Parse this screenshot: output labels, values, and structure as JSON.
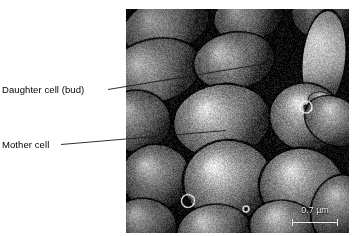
{
  "figure": {
    "kind": "scanning-electron-micrograph"
  },
  "annotations": [
    {
      "id": "daughter-cell",
      "label": "Daughter cell (bud)",
      "leader": {
        "x1": 108,
        "y1": 89.5,
        "x2": 266,
        "y2": 63.5
      }
    },
    {
      "id": "mother-cell",
      "label": "Mother cell",
      "leader": {
        "x1": 61,
        "y1": 144.5,
        "x2": 226,
        "y2": 130.5
      }
    }
  ],
  "scale_bar": {
    "value": "0.7",
    "unit": "µm",
    "text": "0.7 µm",
    "bar_color": "#f0f0f0",
    "text_color": "#f2f2f2"
  },
  "micrograph": {
    "background_color": "#0a0a0a",
    "panel": {
      "left": 126,
      "top": 9,
      "width": 223,
      "height": 224
    },
    "cells": [
      {
        "cx": 40,
        "cy": 16,
        "rx": 44,
        "ry": 27,
        "rot": -18,
        "tone": 0.44,
        "rim": 0.72
      },
      {
        "cx": 122,
        "cy": 8,
        "rx": 34,
        "ry": 24,
        "rot": -12,
        "tone": 0.4,
        "rim": 0.66
      },
      {
        "cx": 196,
        "cy": 6,
        "rx": 30,
        "ry": 24,
        "rot": 8,
        "tone": 0.34,
        "rim": 0.6
      },
      {
        "cx": 28,
        "cy": 62,
        "rx": 47,
        "ry": 31,
        "rot": -14,
        "tone": 0.46,
        "rim": 0.8
      },
      {
        "cx": 108,
        "cy": 52,
        "rx": 40,
        "ry": 28,
        "rot": -10,
        "tone": 0.42,
        "rim": 0.74
      },
      {
        "cx": 198,
        "cy": 50,
        "rx": 21,
        "ry": 48,
        "rot": 6,
        "tone": 0.74,
        "rim": 0.95
      },
      {
        "cx": 10,
        "cy": 112,
        "rx": 34,
        "ry": 30,
        "rot": 0,
        "tone": 0.44,
        "rim": 0.78
      },
      {
        "cx": 96,
        "cy": 112,
        "rx": 48,
        "ry": 36,
        "rot": -8,
        "tone": 0.5,
        "rim": 0.86
      },
      {
        "cx": 180,
        "cy": 108,
        "rx": 36,
        "ry": 33,
        "rot": 14,
        "tone": 0.54,
        "rim": 0.88
      },
      {
        "cx": 197,
        "cy": 94,
        "rx": 15,
        "ry": 10,
        "rot": 20,
        "tone": 0.58,
        "rim": 0.9
      },
      {
        "cx": 208,
        "cy": 112,
        "rx": 30,
        "ry": 23,
        "rot": 28,
        "tone": 0.52,
        "rim": 0.86
      },
      {
        "cx": 30,
        "cy": 168,
        "rx": 34,
        "ry": 32,
        "rot": 0,
        "tone": 0.48,
        "rim": 0.84
      },
      {
        "cx": 102,
        "cy": 172,
        "rx": 44,
        "ry": 40,
        "rot": -4,
        "tone": 0.56,
        "rim": 0.92
      },
      {
        "cx": 176,
        "cy": 178,
        "rx": 42,
        "ry": 38,
        "rot": 10,
        "tone": 0.54,
        "rim": 0.9
      },
      {
        "cx": 18,
        "cy": 216,
        "rx": 32,
        "ry": 26,
        "rot": 6,
        "tone": 0.46,
        "rim": 0.82
      },
      {
        "cx": 88,
        "cy": 222,
        "rx": 36,
        "ry": 26,
        "rot": -6,
        "tone": 0.5,
        "rim": 0.86
      },
      {
        "cx": 158,
        "cy": 218,
        "rx": 34,
        "ry": 26,
        "rot": 8,
        "tone": 0.52,
        "rim": 0.88
      },
      {
        "cx": 214,
        "cy": 200,
        "rx": 28,
        "ry": 34,
        "rot": 18,
        "tone": 0.5,
        "rim": 0.86
      }
    ],
    "bud_scars": [
      {
        "cx": 62,
        "cy": 192,
        "r": 6.5
      },
      {
        "cx": 180,
        "cy": 98,
        "r": 6.0
      },
      {
        "cx": 120,
        "cy": 200,
        "r": 3.0
      }
    ]
  }
}
